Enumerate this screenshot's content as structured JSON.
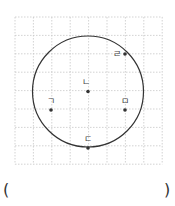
{
  "figure": {
    "grid": {
      "x0": 15,
      "y0": 17,
      "cell": 18.4,
      "cols": 8,
      "rows": 8,
      "color": "#c8c8c8"
    },
    "circle": {
      "cx": 88,
      "cy": 91.5,
      "r": 55.5,
      "stroke": "#333333"
    },
    "points": [
      {
        "id": "giyeok",
        "label": "ㄱ",
        "x": 51,
        "y": 110,
        "lx": 51,
        "ly": 104
      },
      {
        "id": "nieun",
        "label": "ㄴ",
        "x": 88,
        "y": 91.5,
        "lx": 86,
        "ly": 85
      },
      {
        "id": "digeut",
        "label": "ㄷ",
        "x": 88,
        "y": 148,
        "lx": 88,
        "ly": 142
      },
      {
        "id": "rieul",
        "label": "ㄹ",
        "x": 125,
        "y": 54,
        "lx": 117,
        "ly": 57
      },
      {
        "id": "mieum",
        "label": "ㅁ",
        "x": 125,
        "y": 110,
        "lx": 125,
        "ly": 104
      }
    ]
  },
  "answer": {
    "open_paren": "(",
    "close_paren": ")",
    "value": ""
  }
}
